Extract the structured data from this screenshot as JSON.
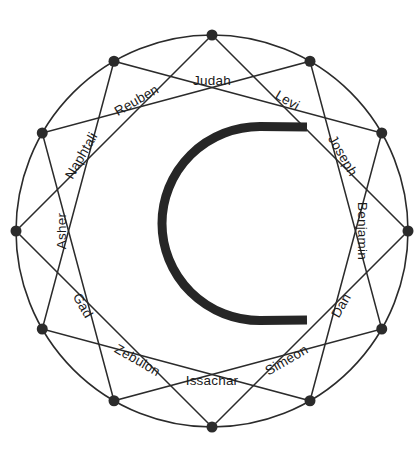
{
  "figure": {
    "background_color": "#ffffff",
    "line_color": "#2b2b2b",
    "thick_curve_color": "#262626",
    "label_color": "#1a1a1a",
    "center": {
      "x": 212,
      "y": 231
    },
    "radius": 196,
    "vertex_dot_radius": 5.5,
    "star": {
      "type": "three-overlapping-squares",
      "squares": [
        [
          0,
          3,
          6,
          9
        ],
        [
          1,
          4,
          7,
          10
        ],
        [
          2,
          5,
          8,
          11
        ]
      ]
    },
    "thick_curve": {
      "shape": "C",
      "opening_side": "right",
      "stroke_width": 9,
      "top_end": {
        "x": 307,
        "y": 127
      },
      "bottom_end": {
        "x": 307,
        "y": 320
      },
      "rx": 98,
      "ry": 97
    }
  },
  "tribes": [
    {
      "name": "Judah",
      "index": 0,
      "angle_deg": 90,
      "vertex": {
        "x": 212,
        "y": 35
      },
      "label_angle": 90,
      "label_radius": 150
    },
    {
      "name": "Levi",
      "index": 1,
      "angle_deg": 60,
      "vertex": {
        "x": 310,
        "y": 63
      },
      "label_angle": 60,
      "label_radius": 150
    },
    {
      "name": "Joseph",
      "index": 2,
      "angle_deg": 30,
      "vertex": {
        "x": 382,
        "y": 133
      },
      "label_angle": 30,
      "label_radius": 150
    },
    {
      "name": "Benjamin",
      "index": 3,
      "angle_deg": 0,
      "vertex": {
        "x": 408,
        "y": 231
      },
      "label_angle": 0,
      "label_radius": 150
    },
    {
      "name": "Dan",
      "index": 4,
      "angle_deg": -30,
      "vertex": {
        "x": 382,
        "y": 329
      },
      "label_angle": -30,
      "label_radius": 150
    },
    {
      "name": "Simeon",
      "index": 5,
      "angle_deg": -60,
      "vertex": {
        "x": 310,
        "y": 399
      },
      "label_angle": -60,
      "label_radius": 150
    },
    {
      "name": "Issachar",
      "index": 6,
      "angle_deg": -90,
      "vertex": {
        "x": 212,
        "y": 427
      },
      "label_angle": -90,
      "label_radius": 150
    },
    {
      "name": "Zebulon",
      "index": 7,
      "angle_deg": -120,
      "vertex": {
        "x": 114,
        "y": 399
      },
      "label_angle": -120,
      "label_radius": 150
    },
    {
      "name": "Gad",
      "index": 8,
      "angle_deg": -150,
      "vertex": {
        "x": 42,
        "y": 329
      },
      "label_angle": -150,
      "label_radius": 150
    },
    {
      "name": "Asher",
      "index": 9,
      "angle_deg": 180,
      "vertex": {
        "x": 16,
        "y": 231
      },
      "label_angle": 180,
      "label_radius": 150
    },
    {
      "name": "Naphtali",
      "index": 10,
      "angle_deg": 150,
      "vertex": {
        "x": 42,
        "y": 133
      },
      "label_angle": 150,
      "label_radius": 150
    },
    {
      "name": "Reuben",
      "index": 11,
      "angle_deg": 120,
      "vertex": {
        "x": 114,
        "y": 63
      },
      "label_angle": 120,
      "label_radius": 150
    }
  ],
  "chart_data": {
    "type": "scatter",
    "xlabel": "",
    "ylabel": "",
    "categories": [
      "Judah",
      "Levi",
      "Joseph",
      "Benjamin",
      "Dan",
      "Simeon",
      "Issachar",
      "Zebulon",
      "Gad",
      "Asher",
      "Naphtali",
      "Reuben"
    ],
    "values": [
      90,
      60,
      30,
      0,
      -30,
      -60,
      -90,
      -120,
      -150,
      180,
      150,
      120
    ],
    "legend": []
  }
}
